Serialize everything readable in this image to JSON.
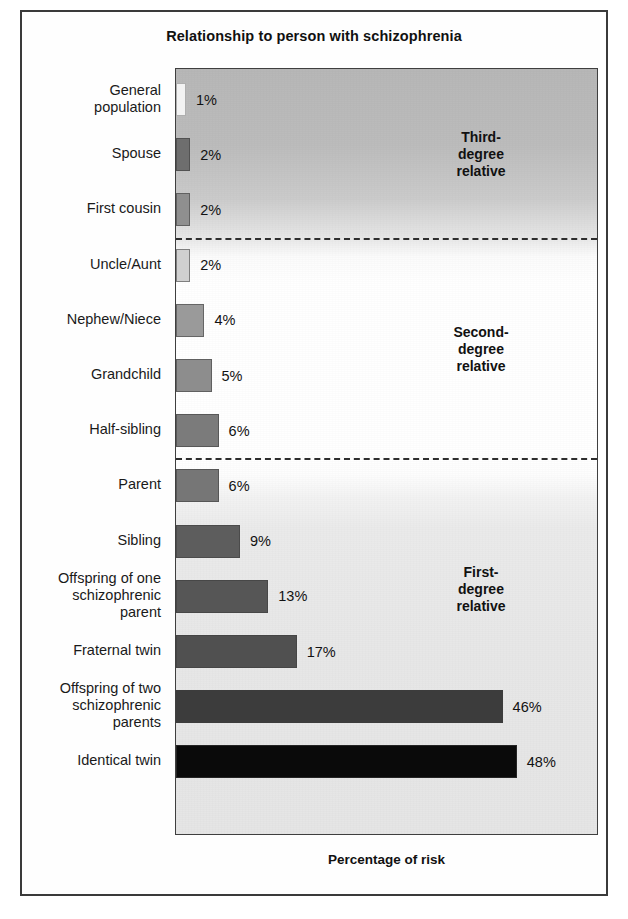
{
  "figure": {
    "title": "Relationship to person with schizophrenia",
    "axis_caption": "Percentage of risk"
  },
  "groups": [
    {
      "name": "third-degree",
      "label": "Third-\ndegree\nrelative"
    },
    {
      "name": "second-degree",
      "label": "Second-\ndegree\nrelative"
    },
    {
      "name": "first-degree",
      "label": "First-\ndegree\nrelative"
    }
  ],
  "chart_data": {
    "type": "bar",
    "orientation": "horizontal",
    "title": "Relationship to person with schizophrenia",
    "xlabel": "Percentage of risk",
    "ylabel": "",
    "xlim": [
      0,
      59
    ],
    "grid": false,
    "legend": null,
    "value_suffix": "%",
    "categories": [
      "General population",
      "Spouse",
      "First cousin",
      "Uncle/Aunt",
      "Nephew/Niece",
      "Grandchild",
      "Half-sibling",
      "Parent",
      "Sibling",
      "Offspring of one schizophrenic parent",
      "Fraternal twin",
      "Offspring of two schizophrenic parents",
      "Identical twin"
    ],
    "values": [
      1,
      2,
      2,
      2,
      4,
      5,
      6,
      6,
      9,
      13,
      17,
      46,
      48
    ],
    "value_labels": [
      "1%",
      "2%",
      "2%",
      "2%",
      "4%",
      "5%",
      "6%",
      "6%",
      "9%",
      "13%",
      "17%",
      "46%",
      "48%"
    ],
    "bar_colors": [
      "#f2f2f2",
      "#6e6e6e",
      "#8f8f8f",
      "#d0d0d0",
      "#9a9a9a",
      "#8d8d8d",
      "#7b7b7b",
      "#767676",
      "#5d5d5d",
      "#565656",
      "#505050",
      "#3c3c3c",
      "#0a0a0a"
    ],
    "group_bands": [
      {
        "label": "Third-degree relative",
        "categories": [
          "General population",
          "Spouse",
          "First cousin"
        ]
      },
      {
        "label": "Second-degree relative",
        "categories": [
          "Uncle/Aunt",
          "Nephew/Niece",
          "Grandchild",
          "Half-sibling"
        ]
      },
      {
        "label": "First-degree relative",
        "categories": [
          "Parent",
          "Sibling",
          "Offspring of one schizophrenic parent",
          "Fraternal twin",
          "Offspring of two schizophrenic parents",
          "Identical twin"
        ]
      }
    ],
    "annotations": [
      "Third-degree relative",
      "Second-degree relative",
      "First-degree relative"
    ]
  },
  "rows": [
    {
      "label": "General\npopulation",
      "value_label": "1%"
    },
    {
      "label": "Spouse",
      "value_label": "2%"
    },
    {
      "label": "First cousin",
      "value_label": "2%"
    },
    {
      "label": "Uncle/Aunt",
      "value_label": "2%"
    },
    {
      "label": "Nephew/Niece",
      "value_label": "4%"
    },
    {
      "label": "Grandchild",
      "value_label": "5%"
    },
    {
      "label": "Half-sibling",
      "value_label": "6%"
    },
    {
      "label": "Parent",
      "value_label": "6%"
    },
    {
      "label": "Sibling",
      "value_label": "9%"
    },
    {
      "label": "Offspring of one\nschizophrenic\nparent",
      "value_label": "13%"
    },
    {
      "label": "Fraternal twin",
      "value_label": "17%"
    },
    {
      "label": "Offspring of two\nschizophrenic\nparents",
      "value_label": "46%"
    },
    {
      "label": "Identical twin",
      "value_label": "48%"
    }
  ]
}
